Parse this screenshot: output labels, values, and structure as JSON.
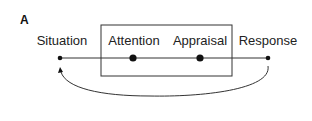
{
  "panel_label": "A",
  "nodes": [
    {
      "id": "situation",
      "label": "Situation",
      "x": 60,
      "size": "small"
    },
    {
      "id": "attention",
      "label": "Attention",
      "x": 133,
      "size": "large"
    },
    {
      "id": "appraisal",
      "label": "Appraisal",
      "x": 200,
      "size": "large"
    },
    {
      "id": "response",
      "label": "Response",
      "x": 268,
      "size": "small"
    }
  ],
  "box": {
    "encloses": [
      "attention",
      "appraisal"
    ]
  },
  "feedback_arrow": {
    "from": "response",
    "to": "situation"
  }
}
